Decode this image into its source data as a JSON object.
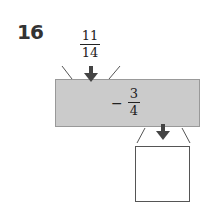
{
  "problem": {
    "number": "16",
    "input": {
      "numerator": "11",
      "denominator": "14"
    },
    "operation": {
      "sign": "−",
      "numerator": "3",
      "denominator": "4"
    },
    "result": ""
  }
}
